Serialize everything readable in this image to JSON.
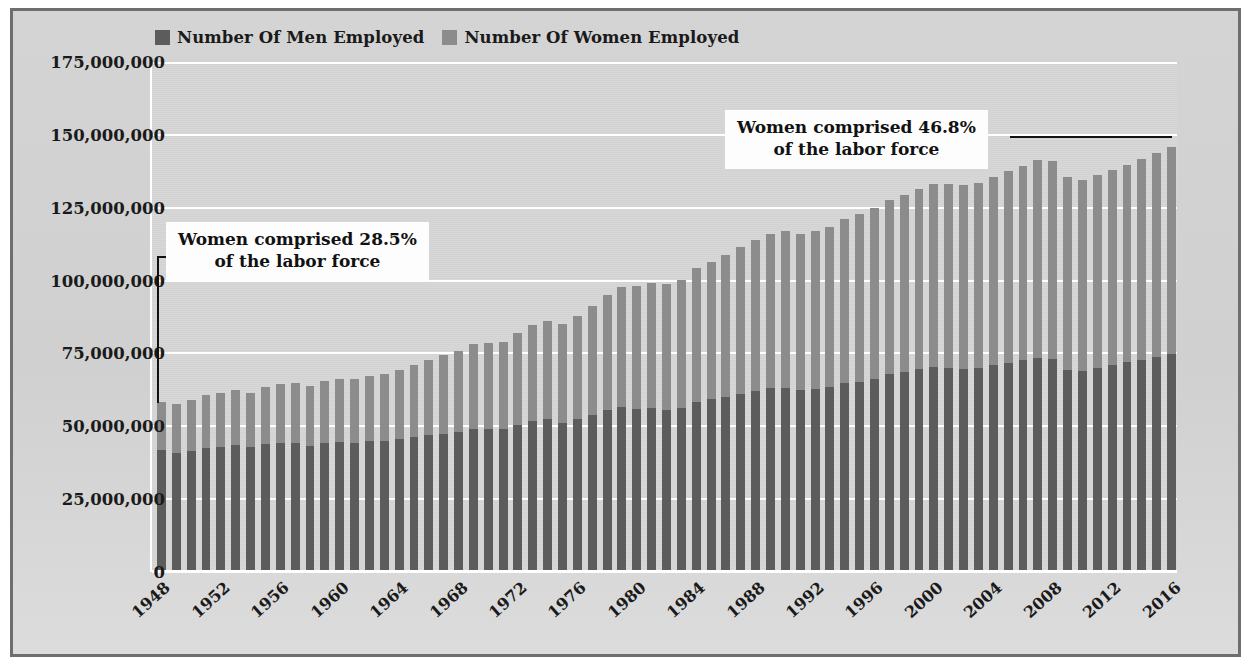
{
  "legend": {
    "entries": [
      {
        "label": "Number Of Men Employed",
        "color": "#5c5c5c",
        "key": "men"
      },
      {
        "label": "Number Of Women Employed",
        "color": "#8c8c8c",
        "key": "women"
      }
    ]
  },
  "annotations": [
    {
      "line1": "Women comprised 28.5%",
      "line2": "of the labor force",
      "target_year": 1948,
      "target_value": 58000000
    },
    {
      "line1": "Women comprised 46.8%",
      "line2": "of the labor force",
      "target_year": 2016,
      "target_value": 151000000
    }
  ],
  "axes": {
    "ytick_labels": [
      "175,000,000",
      "150,000,000",
      "125,000,000",
      "100,000,000",
      "75,000,000",
      "50,000,000",
      "25,000,000",
      "0"
    ],
    "ytick_values": [
      175000000,
      150000000,
      125000000,
      100000000,
      75000000,
      50000000,
      25000000,
      0
    ],
    "xtick_labels": [
      "1948",
      "1952",
      "1956",
      "1960",
      "1964",
      "1968",
      "1972",
      "1976",
      "1980",
      "1984",
      "1988",
      "1992",
      "1996",
      "2000",
      "2004",
      "2008",
      "2012",
      "2016"
    ]
  },
  "chart_data": {
    "type": "bar",
    "subtype": "stacked-vertical",
    "title": "",
    "xlabel": "",
    "ylabel": "",
    "ylim": [
      0,
      175000000
    ],
    "ytick_step": 25000000,
    "grid": "horizontal-white",
    "legend_position": "top-left-outside",
    "categories": [
      "1948",
      "1949",
      "1950",
      "1951",
      "1952",
      "1953",
      "1954",
      "1955",
      "1956",
      "1957",
      "1958",
      "1959",
      "1960",
      "1961",
      "1962",
      "1963",
      "1964",
      "1965",
      "1966",
      "1967",
      "1968",
      "1969",
      "1970",
      "1971",
      "1972",
      "1973",
      "1974",
      "1975",
      "1976",
      "1977",
      "1978",
      "1979",
      "1980",
      "1981",
      "1982",
      "1983",
      "1984",
      "1985",
      "1986",
      "1987",
      "1988",
      "1989",
      "1990",
      "1991",
      "1992",
      "1993",
      "1994",
      "1995",
      "1996",
      "1997",
      "1998",
      "1999",
      "2000",
      "2001",
      "2002",
      "2003",
      "2004",
      "2005",
      "2006",
      "2007",
      "2008",
      "2009",
      "2010",
      "2011",
      "2012",
      "2013",
      "2014",
      "2015",
      "2016"
    ],
    "series": [
      {
        "name": "Number Of Men Employed",
        "color": "#5c5c5c",
        "values": [
          41700000,
          40900000,
          41600000,
          42700000,
          42900000,
          43600000,
          42800000,
          43800000,
          44200000,
          44300000,
          43400000,
          44400000,
          44500000,
          44300000,
          44800000,
          45000000,
          45500000,
          46300000,
          46900000,
          47500000,
          48100000,
          49000000,
          49000000,
          49200000,
          50600000,
          51900000,
          52500000,
          51200000,
          52400000,
          53900000,
          55500000,
          56500000,
          56000000,
          56300000,
          55500000,
          56300000,
          58500000,
          59200000,
          60000000,
          61200000,
          62100000,
          63000000,
          63300000,
          62600000,
          62900000,
          63600000,
          64700000,
          65300000,
          66300000,
          67800000,
          68600000,
          69500000,
          70300000,
          70000000,
          69700000,
          70000000,
          71000000,
          71800000,
          72800000,
          73500000,
          73000000,
          69300000,
          69000000,
          69900000,
          70900000,
          71900000,
          72900000,
          73800000,
          74700000
        ]
      },
      {
        "name": "Number Of Women Employed",
        "color": "#8c8c8c",
        "values": [
          16600000,
          16700000,
          17300000,
          18200000,
          18400000,
          18800000,
          18500000,
          19600000,
          20400000,
          20700000,
          20600000,
          21200000,
          21900000,
          22100000,
          22500000,
          23100000,
          23800000,
          24700000,
          25900000,
          26900000,
          27800000,
          29100000,
          29700000,
          29900000,
          31300000,
          32700000,
          33800000,
          33900000,
          35600000,
          37300000,
          39600000,
          41200000,
          42100000,
          43000000,
          43300000,
          44000000,
          45900000,
          47300000,
          48700000,
          50300000,
          51700000,
          53000000,
          53700000,
          53500000,
          54100000,
          54900000,
          56600000,
          57500000,
          58500000,
          59900000,
          60800000,
          62000000,
          63000000,
          63000000,
          63000000,
          63400000,
          64700000,
          65700000,
          66600000,
          67800000,
          67900000,
          66200000,
          65600000,
          66200000,
          67000000,
          67800000,
          68800000,
          69900000,
          71000000
        ]
      }
    ],
    "annotation_notes": [
      "1948: Women comprised 28.5% of the labor force",
      "2016: Women comprised 46.8% of the labor force"
    ]
  }
}
